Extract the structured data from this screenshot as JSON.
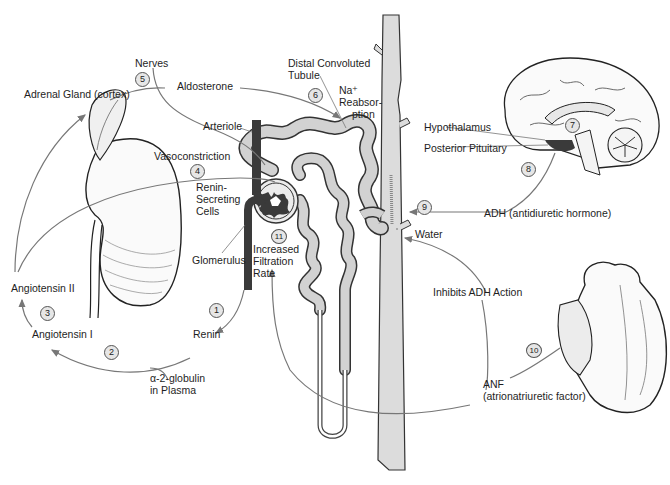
{
  "diagram": {
    "colors": {
      "arrow": "#777777",
      "tissue_dark": "#3a3a3a",
      "tubule_fill": "#d2d2d2",
      "duct_fill": "#dcdcdc",
      "step_fill": "#e6e6e6"
    },
    "labels": {
      "nerves": "Nerves",
      "adrenal_gland": "Adrenal Gland (cortex)",
      "aldosterone": "Aldosterone",
      "distal_tubule_1": "Distal Convoluted",
      "distal_tubule_2": "Tubule",
      "na_1": "Na⁺",
      "na_2": "Reabsor-",
      "na_3": "ption",
      "arteriole": "Arteriole",
      "vasoconstriction": "Vasoconstriction",
      "renin_cells_1": "Renin-",
      "renin_cells_2": "Secreting",
      "renin_cells_3": "Cells",
      "glomerulus": "Glomerulus",
      "gfr_1": "Increased",
      "gfr_2": "Filtration",
      "gfr_3": "Rate",
      "angiotensin_2": "Angiotensin II",
      "angiotensin_1": "Angiotensin I",
      "renin": "Renin",
      "globulin_1": "α-2-globulin",
      "globulin_2": "in Plasma",
      "hypothalamus": "Hypothalamus",
      "posterior_pituitary": "Posterior Pituitary",
      "adh": "ADH (antidiuretic hormone)",
      "water": "Water",
      "inhibits_adh": "Inhibits ADH Action",
      "anf_1": "ANF",
      "anf_2": "(atrionatriuretic factor)"
    },
    "steps": [
      "1",
      "2",
      "3",
      "4",
      "5",
      "6",
      "7",
      "8",
      "9",
      "10",
      "11"
    ]
  }
}
